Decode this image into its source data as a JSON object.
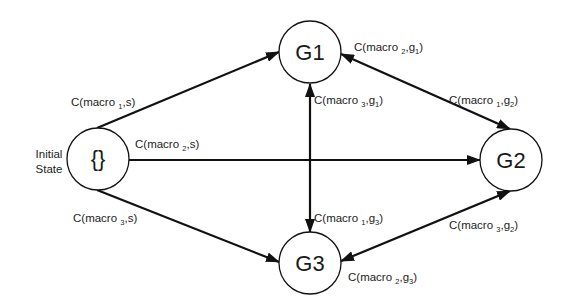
{
  "diagram": {
    "type": "state-transition-graph",
    "nodes": [
      {
        "id": "initial",
        "label": "{}",
        "side_label": [
          "Initial",
          "State"
        ],
        "cx": 98,
        "cy": 159,
        "r": 31
      },
      {
        "id": "G1",
        "label": "G1",
        "cx": 310,
        "cy": 52,
        "r": 31
      },
      {
        "id": "G2",
        "label": "G2",
        "cx": 511,
        "cy": 160,
        "r": 31
      },
      {
        "id": "G3",
        "label": "G3",
        "cx": 310,
        "cy": 263,
        "r": 31
      }
    ],
    "edges": [
      {
        "from": "initial",
        "to": "G1",
        "directed": "one-way",
        "label": {
          "pre": "C(macro ",
          "sub": "1",
          "post": ",s)"
        }
      },
      {
        "from": "initial",
        "to": "G2",
        "directed": "one-way",
        "label": {
          "pre": "C(macro ",
          "sub": "2",
          "post": ",s)"
        }
      },
      {
        "from": "initial",
        "to": "G3",
        "directed": "one-way",
        "label": {
          "pre": "C(macro ",
          "sub": "3",
          "post": ",s)"
        }
      },
      {
        "from": "G1",
        "to": "G2",
        "directed": "two-way",
        "labels": [
          {
            "pre": "C(macro ",
            "sub": "2",
            "mid": ",g",
            "sub2": "1",
            "post": ")"
          },
          {
            "pre": "C(macro ",
            "sub": "1",
            "mid": ",g",
            "sub2": "2",
            "post": ")"
          }
        ]
      },
      {
        "from": "G1",
        "to": "G3",
        "directed": "two-way",
        "labels": [
          {
            "pre": "C(macro ",
            "sub": "3",
            "mid": ",g",
            "sub2": "1",
            "post": ")"
          },
          {
            "pre": "C(macro ",
            "sub": "1",
            "mid": ",g",
            "sub2": "3",
            "post": ")"
          }
        ]
      },
      {
        "from": "G2",
        "to": "G3",
        "directed": "two-way",
        "labels": [
          {
            "pre": "C(macro ",
            "sub": "3",
            "mid": ",g",
            "sub2": "2",
            "post": ")"
          },
          {
            "pre": "C(macro ",
            "sub": "2",
            "mid": ",g",
            "sub2": "3",
            "post": ")"
          }
        ]
      }
    ]
  },
  "labels": {
    "initial_node": "{}",
    "initial_side_1": "Initial",
    "initial_side_2": "State",
    "g1": "G1",
    "g2": "G2",
    "g3": "G3",
    "macro": "C(macro ",
    "s_close": ",s)",
    "g": ",g",
    "close": ")",
    "n1": "1",
    "n2": "2",
    "n3": "3"
  },
  "colors": {
    "stroke": "#111111",
    "text": "#222222",
    "background": "#ffffff"
  }
}
